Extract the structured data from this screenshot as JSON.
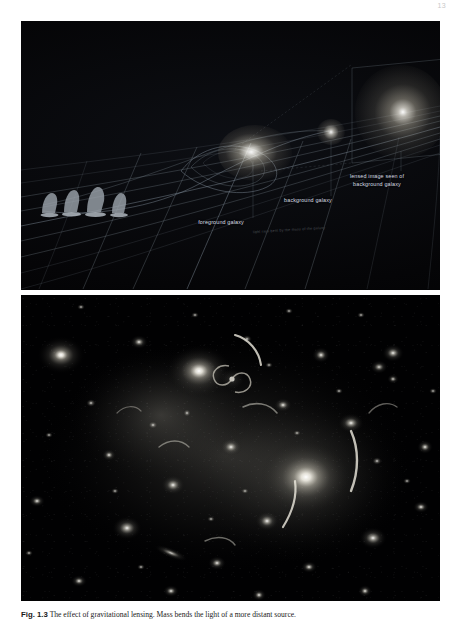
{
  "page": {
    "number": "13",
    "background_color": "#ffffff"
  },
  "figure": {
    "label": "Fig. 1.3",
    "caption": "The effect of gravitational lensing. Mass bends the light of a more distant source.",
    "panels": [
      {
        "name": "spacetime-lensing-diagram",
        "type": "illustration",
        "background_color": "#050507",
        "grid_color": "#7d8a96",
        "labels": [
          {
            "key": "lensed",
            "text": "lensed image seen of\nbackground galaxy"
          },
          {
            "key": "background",
            "text": "background galaxy"
          },
          {
            "key": "foreground",
            "text": "foreground galaxy"
          }
        ],
        "micro_text": "light rays bent by the mass of the galaxy",
        "objects": [
          {
            "name": "observatory-telescopes",
            "count": 4
          },
          {
            "name": "foreground-galaxy-glow"
          },
          {
            "name": "background-galaxy-point"
          },
          {
            "name": "lensed-image-inset-panel"
          }
        ]
      },
      {
        "name": "galaxy-cluster-photograph",
        "type": "photograph",
        "background_color": "#010102",
        "features": [
          "elliptical cluster galaxies",
          "spiral galaxy",
          "gravitational lensing arcs",
          "foreground stars"
        ]
      }
    ]
  }
}
